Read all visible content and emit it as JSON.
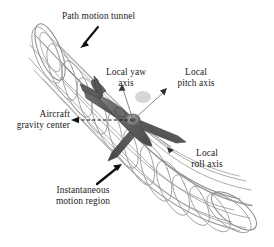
{
  "figure": {
    "background_color": "#ffffff",
    "mesh_color": "#9a9a9a",
    "aircraft_color": "#5a5a5a",
    "label_color": "#1b1b1b",
    "arrow_color": "#111111"
  },
  "labels": {
    "path_motion_tunnel": {
      "text": "Path motion tunnel",
      "lines": [
        "Path motion tunnel"
      ]
    },
    "local_yaw_axis": {
      "text": "Local yaw axis",
      "line1": "Local yaw",
      "line2": "axis"
    },
    "local_pitch_axis": {
      "text": "Local pitch axis",
      "line1": "Local",
      "line2": "pitch axis"
    },
    "aircraft_gravity_center": {
      "text": "Aircraft gravity center",
      "line1": "Aircraft",
      "line2": "gravity center"
    },
    "local_roll_axis": {
      "text": "Local roll axis",
      "line1": "Local",
      "line2": "roll axis"
    },
    "instantaneous_motion_region": {
      "text": "Instantaneous motion region",
      "line1": "Instantaneous",
      "line2": "motion region"
    }
  },
  "annotations": {
    "tunnel_leader": "solid-black-arrow-down-left",
    "gravity_center_leader": "dashed-double-arrow-horizontal",
    "pitch_axis_marker": "dark-triangle-arrowhead",
    "roll_axis_marker": "dark-triangle-arrowhead",
    "yaw_axis_marker": "dark-triangle-arrowhead",
    "motion_region_leader": "solid-black-arrow-up-right"
  }
}
